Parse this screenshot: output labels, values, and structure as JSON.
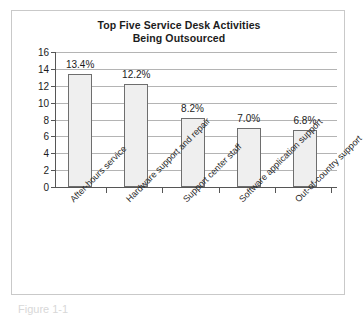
{
  "chart_data": {
    "type": "bar",
    "title": "Top Five Service Desk Activities Being Outsourced",
    "title_line1": "Top Five Service Desk Activities",
    "title_line2": "Being Outsourced",
    "xlabel": "",
    "ylabel": "",
    "categories": [
      "After-hours service",
      "Hardware support and repair",
      "Support center staff",
      "Software application support",
      "Out-of-country support"
    ],
    "values": [
      13.4,
      12.2,
      8.2,
      7.0,
      6.8
    ],
    "data_labels": [
      "13.4%",
      "12.2%",
      "8.2%",
      "7.0%",
      "6.8%"
    ],
    "ylim": [
      0,
      16
    ],
    "yticks": [
      0,
      2,
      4,
      6,
      8,
      10,
      12,
      14,
      16
    ],
    "ytick_labels": [
      "0",
      "2",
      "4",
      "6",
      "8",
      "10",
      "12",
      "14",
      "16"
    ],
    "grid": true,
    "legend": false,
    "bar_fill_color": "#efefef",
    "bar_edge_color": "#6e6e6e",
    "gridline_color": "#b4b4b4",
    "axis_color": "#565656",
    "frame_color": "#c9c9c9",
    "background_color": "#ffffff"
  },
  "caption": {
    "clipped_text": "Figure 1-1"
  }
}
